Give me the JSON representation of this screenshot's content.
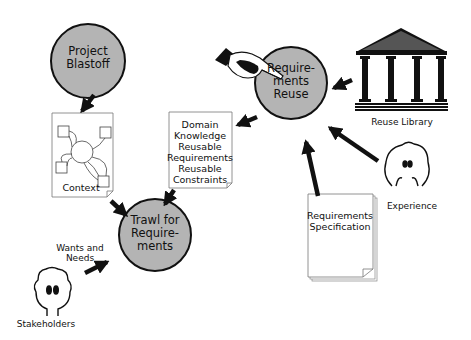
{
  "diagram": {
    "colors": {
      "circle_fill": "#b4b4b4",
      "stroke": "#111111",
      "doc_fill": "#ffffff",
      "background": "#ffffff"
    },
    "activities": [
      {
        "id": "project-blastoff",
        "lines": [
          "Project",
          "Blastoff"
        ]
      },
      {
        "id": "requirements-reuse",
        "lines": [
          "Require-",
          "ments",
          "Reuse"
        ]
      },
      {
        "id": "trawl-for-requirements",
        "lines": [
          "Trawl for",
          "Require-",
          "ments"
        ]
      }
    ],
    "documents": {
      "context": {
        "label": "Context"
      },
      "domain_knowledge": {
        "lines": [
          "Domain",
          "Knowledge",
          "Reusable",
          "Requirements",
          "Reusable",
          "Constraints"
        ]
      },
      "requirements_specification": {
        "lines": [
          "Requirements",
          "Specification"
        ]
      }
    },
    "actors": {
      "reuse_library": {
        "label": "Reuse Library"
      },
      "experience": {
        "label": "Experience"
      },
      "stakeholders": {
        "label": "Stakeholders"
      }
    },
    "flows": {
      "wants_and_needs": {
        "lines": [
          "Wants and",
          "Needs"
        ]
      }
    },
    "icons": [
      "pointing-hand-icon",
      "temple-icon",
      "experience-face-icon",
      "stakeholder-head-icon",
      "context-diagram-icon"
    ]
  }
}
